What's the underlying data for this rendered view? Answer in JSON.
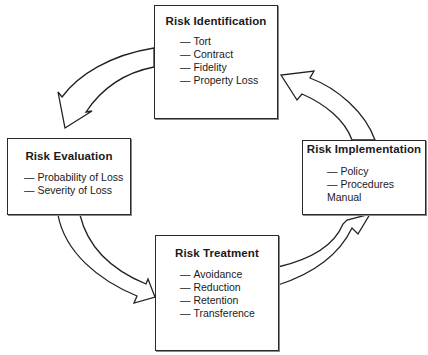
{
  "diagram": {
    "type": "cycle",
    "nodes": [
      {
        "id": "identification",
        "title": "Risk Identification",
        "items": [
          "Tort",
          "Contract",
          "Fidelity",
          "Property Loss"
        ]
      },
      {
        "id": "evaluation",
        "title": "Risk Evaluation",
        "items": [
          "Probability of Loss",
          "Severity of Loss"
        ]
      },
      {
        "id": "treatment",
        "title": "Risk Treatment",
        "items": [
          "Avoidance",
          "Reduction",
          "Retention",
          "Transference"
        ]
      },
      {
        "id": "implementation",
        "title": "Risk Implementation",
        "items": [
          "Policy",
          "Procedures Manual"
        ]
      }
    ],
    "edges": [
      {
        "from": "identification",
        "to": "evaluation"
      },
      {
        "from": "evaluation",
        "to": "treatment"
      },
      {
        "from": "treatment",
        "to": "implementation"
      },
      {
        "from": "implementation",
        "to": "identification"
      }
    ],
    "colors": {
      "stroke": "#2a2a2a",
      "fill": "#ffffff"
    }
  }
}
